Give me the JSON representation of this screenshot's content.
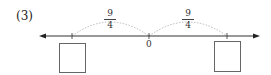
{
  "problem": {
    "label": "(3)"
  },
  "number_line": {
    "origin_label": "0",
    "arrows": "both",
    "ticks": [
      {
        "position": "left",
        "value": "-9/4",
        "shown_label": null
      },
      {
        "position": "origin",
        "value": "0",
        "shown_label": "0"
      },
      {
        "position": "right",
        "value": "9/4",
        "shown_label": null
      }
    ],
    "jumps": [
      {
        "from": "left-tick",
        "to": "0",
        "numerator": "9",
        "denominator": "4"
      },
      {
        "from": "0",
        "to": "right-tick",
        "numerator": "9",
        "denominator": "4"
      }
    ],
    "answer_boxes": [
      {
        "under": "left-tick",
        "value": ""
      },
      {
        "under": "right-tick",
        "value": ""
      }
    ]
  },
  "colors": {
    "axis": "#333333",
    "arc": "#aaaaaa",
    "box_border": "#666666"
  }
}
